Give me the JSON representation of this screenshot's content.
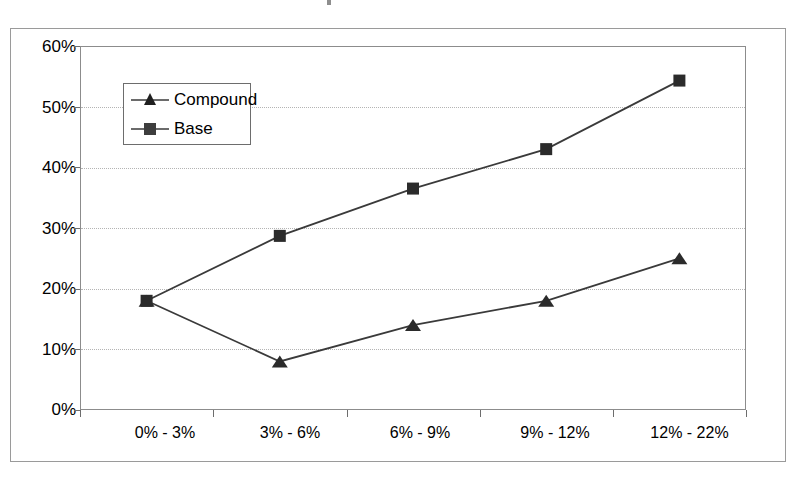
{
  "chart_data": {
    "type": "line",
    "title": "",
    "xlabel": "",
    "ylabel": "",
    "categories": [
      "0% - 3%",
      "3% - 6%",
      "6% - 9%",
      "9% - 12%",
      "12% - 22%"
    ],
    "series": [
      {
        "name": "Compound",
        "marker": "triangle",
        "values": [
          18,
          8,
          14,
          18,
          25
        ]
      },
      {
        "name": "Base",
        "marker": "square",
        "values": [
          18,
          28.7,
          36.5,
          43,
          54.3
        ]
      }
    ],
    "ylim": [
      0,
      60
    ],
    "ytick_labels": [
      "60%",
      "50%",
      "40%",
      "30%",
      "20%",
      "10%",
      "0%"
    ],
    "ytick_values": [
      60,
      50,
      40,
      30,
      20,
      10,
      0
    ],
    "grid": "horizontal-dotted",
    "legend_position": "inside-upper-left",
    "colors": {
      "series_line": "#3a3a3a",
      "marker": "#2b2b2b",
      "gridline": "#b4b4b4",
      "axis": "#8c8c8c",
      "frame": "#9a9a9a",
      "background": "#ffffff",
      "text": "#000000"
    }
  },
  "ytick_labels": {
    "t0": "60%",
    "t1": "50%",
    "t2": "40%",
    "t3": "30%",
    "t4": "20%",
    "t5": "10%",
    "t6": "0%"
  },
  "xtick_labels": {
    "c0": "0% - 3%",
    "c1": "3% - 6%",
    "c2": "6% - 9%",
    "c3": "9% - 12%",
    "c4": "12% - 22%"
  },
  "legend": {
    "compound_label": "Compound",
    "base_label": "Base"
  }
}
